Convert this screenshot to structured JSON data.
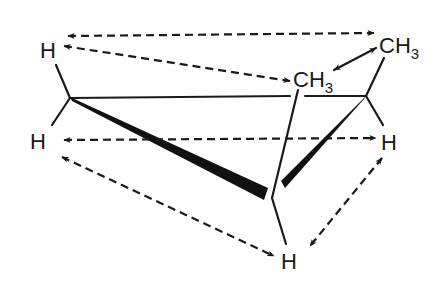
{
  "diagram": {
    "type": "chemical-structure",
    "atoms": [
      {
        "id": "h_top_left",
        "label": "H"
      },
      {
        "id": "h_mid_left",
        "label": "H"
      },
      {
        "id": "ch3_top_right",
        "label": "CH",
        "sub": "3"
      },
      {
        "id": "ch3_center",
        "label": "CH",
        "sub": "3"
      },
      {
        "id": "h_right",
        "label": "H"
      },
      {
        "id": "h_bottom",
        "label": "H"
      }
    ],
    "noe_correlations": [
      {
        "from": "h_top_left",
        "to": "ch3_top_right",
        "style": "dashed-double-arrow"
      },
      {
        "from": "h_top_left",
        "to": "ch3_center",
        "style": "dashed-double-arrow"
      },
      {
        "from": "ch3_center",
        "to": "ch3_top_right",
        "style": "solid-double-arrow"
      },
      {
        "from": "h_mid_left",
        "to": "h_right",
        "style": "dashed-double-arrow"
      },
      {
        "from": "h_mid_left",
        "to": "h_bottom",
        "style": "dashed-double-arrow"
      },
      {
        "from": "h_right",
        "to": "h_bottom",
        "style": "dashed-double-arrow"
      }
    ],
    "colors": {
      "ink": "#1a1a1a",
      "background": "#ffffff"
    }
  }
}
